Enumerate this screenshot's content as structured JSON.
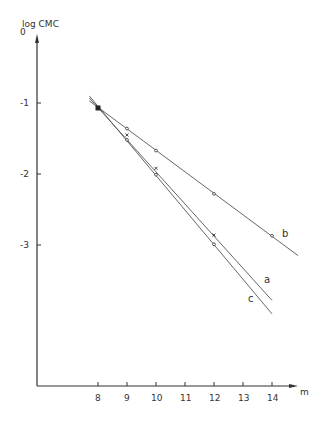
{
  "chart_data": {
    "type": "line",
    "title": "",
    "xlabel": "m",
    "ylabel": "log CMC",
    "x_ticks": [
      8,
      9,
      10,
      11,
      12,
      13,
      14
    ],
    "y_ticks": [
      0,
      -1,
      -2,
      -3
    ],
    "y_tick_labels": [
      "0",
      "-1",
      "-2",
      "-3"
    ],
    "xlim": [
      6.0,
      14.9
    ],
    "ylim": [
      -4.9,
      0
    ],
    "grid": false,
    "legend": "none (curves labeled inline: a, b, c)",
    "series": [
      {
        "name": "a",
        "marker": "x",
        "x": [
          8,
          9,
          10,
          12
        ],
        "y": [
          -1.07,
          -1.45,
          -1.92,
          -2.86
        ],
        "fit_line": {
          "x": [
            7.7,
            14.0
          ],
          "y": [
            -0.93,
            -3.78
          ]
        }
      },
      {
        "name": "b",
        "marker": "o",
        "x": [
          8,
          9,
          10,
          12,
          14
        ],
        "y": [
          -1.07,
          -1.36,
          -1.67,
          -2.28,
          -2.87
        ],
        "fit_line": {
          "x": [
            7.7,
            14.9
          ],
          "y": [
            -0.97,
            -3.15
          ]
        }
      },
      {
        "name": "c",
        "marker": "o",
        "x": [
          8,
          9,
          10,
          12
        ],
        "y": [
          -1.07,
          -1.52,
          -2.01,
          -2.99
        ],
        "fit_line": {
          "x": [
            7.7,
            14.0
          ],
          "y": [
            -0.9,
            -3.97
          ]
        }
      }
    ]
  },
  "labels": {
    "y_axis": "log CMC",
    "x_axis": "m",
    "curve_a": "a",
    "curve_b": "b",
    "curve_c": "c"
  }
}
